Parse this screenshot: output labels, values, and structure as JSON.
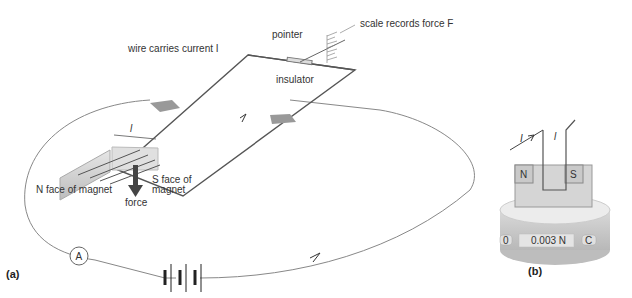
{
  "panel_a": {
    "label": "(a)",
    "annotations": {
      "wire": "wire carries current I",
      "pointer": "pointer",
      "scale": "scale records force F",
      "insulator": "insulator",
      "length": "l",
      "n_face": "N face of magnet",
      "s_face_1": "S face of",
      "s_face_2": "magnet",
      "force": "force",
      "ammeter": "A"
    }
  },
  "panel_b": {
    "label": "(b)",
    "annotations": {
      "current": "I",
      "length": "l",
      "north": "N",
      "south": "S",
      "button_left": "0",
      "button_right": "C",
      "display": "0.003 N"
    }
  }
}
